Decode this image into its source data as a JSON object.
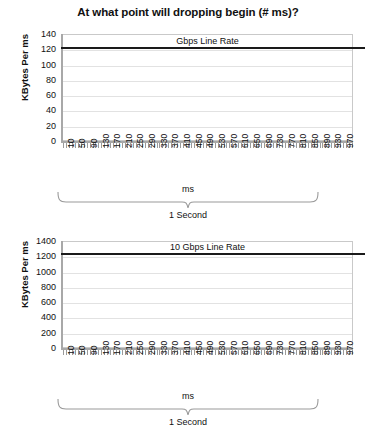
{
  "title": "At what point will dropping begin (# ms)?",
  "chart_data": [
    {
      "type": "line",
      "title": "At what point will dropping begin (# ms)?",
      "annotation": "Gbps Line Rate",
      "xlabel": "ms",
      "ylabel": "KBytes Per ms",
      "ylim": [
        0,
        140
      ],
      "yticks": [
        0,
        20,
        40,
        60,
        80,
        100,
        120,
        140
      ],
      "xlim": [
        0,
        1000
      ],
      "xticks": [
        10,
        50,
        90,
        130,
        170,
        210,
        250,
        290,
        330,
        370,
        410,
        450,
        490,
        530,
        570,
        610,
        650,
        690,
        730,
        770,
        810,
        850,
        890,
        930,
        970
      ],
      "grid": true,
      "legend": "none",
      "series": [
        {
          "name": "Gbps Line Rate",
          "type": "threshold-line",
          "value": 127,
          "color": "#1a1a1a"
        }
      ],
      "span_label": "1 Second"
    },
    {
      "type": "line",
      "annotation": "10 Gbps Line Rate",
      "xlabel": "ms",
      "ylabel": "KBytes Per ms",
      "ylim": [
        0,
        1400
      ],
      "yticks": [
        0,
        200,
        400,
        600,
        800,
        1000,
        1200,
        1400
      ],
      "xlim": [
        0,
        1000
      ],
      "xticks": [
        10,
        50,
        90,
        130,
        170,
        210,
        250,
        290,
        330,
        370,
        410,
        450,
        490,
        530,
        570,
        610,
        650,
        690,
        730,
        770,
        810,
        850,
        890,
        930,
        970
      ],
      "grid": true,
      "legend": "none",
      "series": [
        {
          "name": "10 Gbps Line Rate",
          "type": "threshold-line",
          "value": 1250,
          "color": "#1a1a1a"
        }
      ],
      "span_label": "1 Second"
    }
  ],
  "charts": [
    {
      "annotation": "Gbps Line Rate",
      "ylabel": "KBytes Per ms",
      "xlabel": "ms",
      "span_label": "1 Second",
      "yticks": [
        "140",
        "120",
        "100",
        "80",
        "60",
        "40",
        "20",
        "0"
      ]
    },
    {
      "annotation": "10 Gbps Line Rate",
      "ylabel": "KBytes Per ms",
      "xlabel": "ms",
      "span_label": "1 Second",
      "yticks": [
        "1400",
        "1200",
        "1000",
        "800",
        "600",
        "400",
        "200",
        "0"
      ]
    }
  ]
}
